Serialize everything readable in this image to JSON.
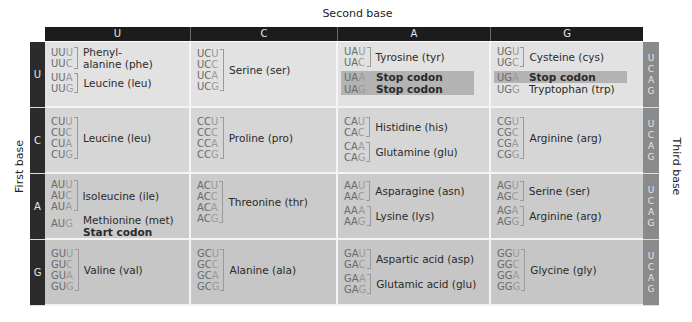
{
  "labels": {
    "second_base": "Second base",
    "first_base": "First base",
    "third_base": "Third base"
  },
  "second_base_headers": [
    "U",
    "C",
    "A",
    "G"
  ],
  "first_base_rows": [
    "U",
    "C",
    "A",
    "G"
  ],
  "third_base": [
    "U",
    "C",
    "A",
    "G"
  ],
  "colors": {
    "header_bg": "#1c1c1c",
    "first_base_bg": "#2b2b2b",
    "third_base_bg": "#8a8a8a",
    "stop_highlight": "#b3b3b3",
    "cell_bg": "#d6d6d6"
  },
  "table": {
    "U": {
      "U": [
        {
          "codons": [
            "UUU",
            "UUC"
          ],
          "amino_acid": "Phenyl-alanine (phe)",
          "lines": [
            "Phenyl-",
            "alanine (phe)"
          ]
        },
        {
          "codons": [
            "UUA",
            "UUG"
          ],
          "amino_acid": "Leucine (leu)",
          "lines": [
            "Leucine (leu)"
          ]
        }
      ],
      "C": [
        {
          "codons": [
            "UCU",
            "UCC",
            "UCA",
            "UCG"
          ],
          "amino_acid": "Serine (ser)",
          "lines": [
            "Serine (ser)"
          ]
        }
      ],
      "A": [
        {
          "codons": [
            "UAU",
            "UAC"
          ],
          "amino_acid": "Tyrosine (tyr)",
          "lines": [
            "Tyrosine (tyr)"
          ]
        },
        {
          "codons": [
            "UAA"
          ],
          "amino_acid": "Stop codon",
          "stop": true
        },
        {
          "codons": [
            "UAG"
          ],
          "amino_acid": "Stop codon",
          "stop": true
        }
      ],
      "G": [
        {
          "codons": [
            "UGU",
            "UGC"
          ],
          "amino_acid": "Cysteine (cys)",
          "lines": [
            "Cysteine (cys)"
          ]
        },
        {
          "codons": [
            "UGA"
          ],
          "amino_acid": "Stop codon",
          "stop": true
        },
        {
          "codons": [
            "UGG"
          ],
          "amino_acid": "Tryptophan (trp)"
        }
      ]
    },
    "C": {
      "U": [
        {
          "codons": [
            "CUU",
            "CUC",
            "CUA",
            "CUG"
          ],
          "amino_acid": "Leucine (leu)"
        }
      ],
      "C": [
        {
          "codons": [
            "CCU",
            "CCC",
            "CCA",
            "CCG"
          ],
          "amino_acid": "Proline (pro)"
        }
      ],
      "A": [
        {
          "codons": [
            "CAU",
            "CAC"
          ],
          "amino_acid": "Histidine (his)"
        },
        {
          "codons": [
            "CAA",
            "CAG"
          ],
          "amino_acid": "Glutamine (glu)"
        }
      ],
      "G": [
        {
          "codons": [
            "CGU",
            "CGC",
            "CGA",
            "CGG"
          ],
          "amino_acid": "Arginine (arg)"
        }
      ]
    },
    "A": {
      "U": [
        {
          "codons": [
            "AUU",
            "AUC",
            "AUA"
          ],
          "amino_acid": "Isoleucine (ile)"
        },
        {
          "codons": [
            "AUG"
          ],
          "amino_acid": "Methionine (met)",
          "note": "Start codon"
        }
      ],
      "C": [
        {
          "codons": [
            "ACU",
            "ACC",
            "ACA",
            "ACG"
          ],
          "amino_acid": "Threonine (thr)"
        }
      ],
      "A": [
        {
          "codons": [
            "AAU",
            "AAC"
          ],
          "amino_acid": "Asparagine (asn)"
        },
        {
          "codons": [
            "AAA",
            "AAG"
          ],
          "amino_acid": "Lysine (lys)"
        }
      ],
      "G": [
        {
          "codons": [
            "AGU",
            "AGC"
          ],
          "amino_acid": "Serine (ser)"
        },
        {
          "codons": [
            "AGA",
            "AGG"
          ],
          "amino_acid": "Arginine (arg)"
        }
      ]
    },
    "G": {
      "U": [
        {
          "codons": [
            "GUU",
            "GUC",
            "GUA",
            "GUG"
          ],
          "amino_acid": "Valine (val)"
        }
      ],
      "C": [
        {
          "codons": [
            "GCU",
            "GCC",
            "GCA",
            "GCG"
          ],
          "amino_acid": "Alanine (ala)"
        }
      ],
      "A": [
        {
          "codons": [
            "GAU",
            "GAC"
          ],
          "amino_acid": "Aspartic acid (asp)"
        },
        {
          "codons": [
            "GAA",
            "GAG"
          ],
          "amino_acid": "Glutamic acid (glu)"
        }
      ],
      "G": [
        {
          "codons": [
            "GGU",
            "GGC",
            "GGA",
            "GGG"
          ],
          "amino_acid": "Glycine (gly)"
        }
      ]
    }
  },
  "text": {
    "uuu": "UU",
    "b_u": "U",
    "b_c": "C",
    "b_a": "A",
    "b_g": "G",
    "phe_1": "Phenyl-",
    "phe_2": "alanine (phe)",
    "leu": "Leucine (leu)",
    "ser": "Serine (ser)",
    "tyr": "Tyrosine (tyr)",
    "stop": "Stop codon",
    "cys": "Cysteine (cys)",
    "trp": "Tryptophan (trp)",
    "pro": "Proline (pro)",
    "his": "Histidine (his)",
    "gln": "Glutamine (glu)",
    "arg": "Arginine (arg)",
    "ile": "Isoleucine (ile)",
    "met": "Methionine (met)",
    "start": "Start codon",
    "thr": "Threonine (thr)",
    "asn": "Asparagine (asn)",
    "lys": "Lysine (lys)",
    "val": "Valine (val)",
    "ala": "Alanine (ala)",
    "asp": "Aspartic acid (asp)",
    "glu": "Glutamic acid (glu)",
    "gly": "Glycine (gly)"
  },
  "prefix": {
    "UU": "UU",
    "UC": "UC",
    "UA": "UA",
    "UG": "UG",
    "CU": "CU",
    "CC": "CC",
    "CA": "CA",
    "CG": "CG",
    "AU": "AU",
    "AC": "AC",
    "AA": "AA",
    "AG": "AG",
    "GU": "GU",
    "GC": "GC",
    "GA": "GA",
    "GG": "GG"
  }
}
